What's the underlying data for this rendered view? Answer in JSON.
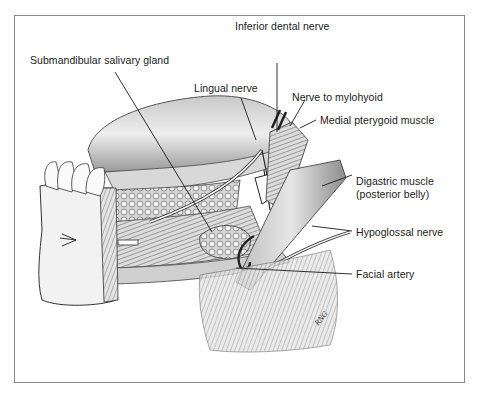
{
  "figure": {
    "type": "anatomical illustration",
    "signature": "RNG"
  },
  "labels": [
    {
      "id": "submandibular-salivary-gland",
      "text": "Submandibular salivary gland"
    },
    {
      "id": "inferior-dental-nerve",
      "text": "Inferior dental nerve"
    },
    {
      "id": "lingual-nerve",
      "text": "Lingual nerve"
    },
    {
      "id": "nerve-to-mylohyoid",
      "text": "Nerve to mylohyoid"
    },
    {
      "id": "medial-pterygoid-muscle",
      "text": "Medial pterygoid muscle"
    },
    {
      "id": "digastric-muscle",
      "text": "Digastric muscle"
    },
    {
      "id": "digastric-muscle-sub",
      "text": "(posterior belly)"
    },
    {
      "id": "hypoglossal-nerve",
      "text": "Hypoglossal nerve"
    },
    {
      "id": "facial-artery",
      "text": "Facial artery"
    }
  ],
  "colors": {
    "frame": "#8a8a8a",
    "ink": "#1a1a1a",
    "shade": "#9a9a9a"
  }
}
